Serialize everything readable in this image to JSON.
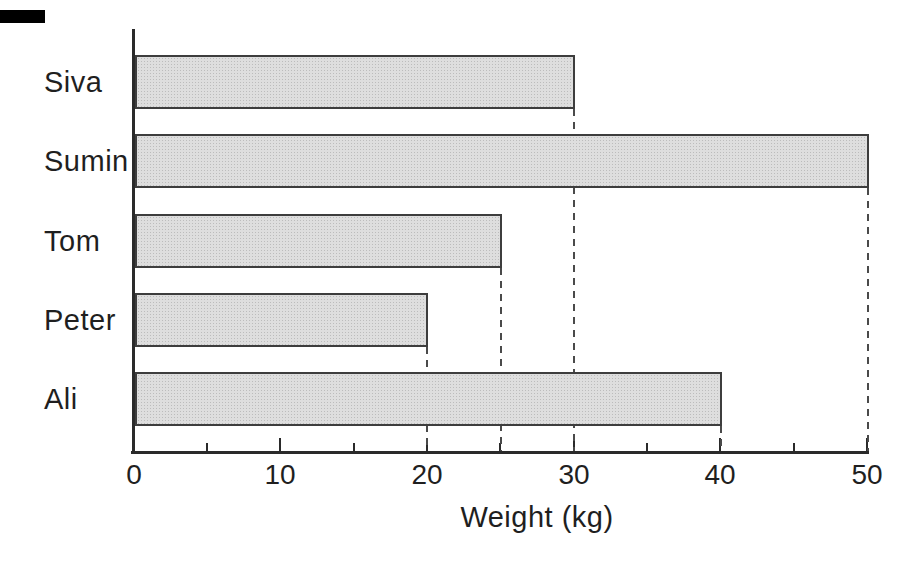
{
  "chart_data": {
    "type": "bar",
    "orientation": "horizontal",
    "categories": [
      "Siva",
      "Sumin",
      "Tom",
      "Peter",
      "Ali"
    ],
    "values": [
      30,
      50,
      25,
      20,
      40
    ],
    "title": "",
    "xlabel": "Weight (kg)",
    "ylabel": "",
    "xlim": [
      0,
      50
    ],
    "x_tick_labels": [
      "0",
      "10",
      "20",
      "30",
      "40",
      "50"
    ],
    "x_major_ticks": [
      10,
      20,
      30,
      40,
      50
    ],
    "x_minor_ticks": [
      5,
      15,
      25,
      35,
      45
    ],
    "grid": "dashed drop lines from each bar end to x-axis",
    "legend": "none"
  },
  "colors": {
    "background": "#ffffff",
    "bar_fill": "#dedede",
    "bar_dot": "#bcbcbc",
    "bar_border": "#3d3d3d",
    "axis": "#2a2a2a",
    "dashed_line": "#4a4a4a",
    "text": "#1f1f1f",
    "scan_artifact": "#000000"
  }
}
